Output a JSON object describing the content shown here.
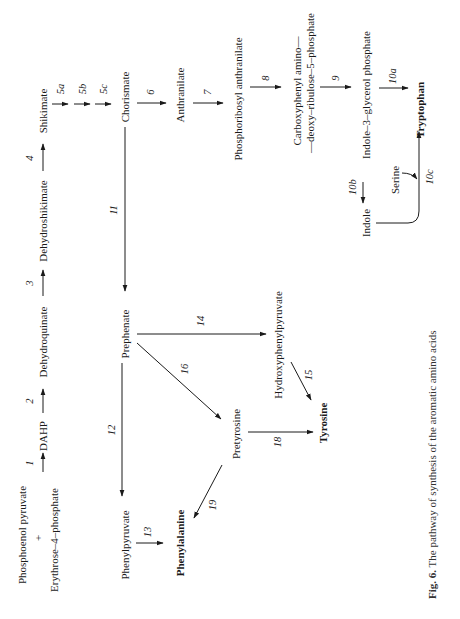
{
  "figure": {
    "caption_label": "Fig. 6.",
    "caption_text": "The pathway of synthesis of the aromatic amino acids",
    "orientation": "rotated 90° counter-clockwise"
  },
  "compounds": {
    "phosphoenol_pyruvate": "Phosphoenol pyruvate",
    "plus": "+",
    "erythrose_4_phosphate": "Erythrose–4–phosphate",
    "dahp": "DAHP",
    "dehydroquinate": "Dehydroquinate",
    "dehydroshikimate": "Dehydroshikimate",
    "shikimate": "Shikimate",
    "chorismate": "Chorismate",
    "anthranilate": "Anthranilate",
    "phosphoribosyl_anthranilate": "Phosphoribosyl  anthranilate",
    "carboxyphenyl_line1": "Carboxyphenyl  amino—",
    "carboxyphenyl_line2": "—deoxy–ribulose–5–phosphate",
    "indole_3_glycerol_phosphate": "Indole–3–glycerol phosphate",
    "tryptophan": "Tryptophan",
    "indole": "Indole",
    "serine": "Serine",
    "prephenate": "Prephenate",
    "phenylpyruvate": "Phenylpyruvate",
    "phenylalanine": "Phenylalanine",
    "hydroxyphenylpyruvate": "Hydroxyphenylpyruvate",
    "pretyrosine": "Pretyrosine",
    "tyrosine": "Tyrosine"
  },
  "steps": {
    "s1": "1",
    "s2": "2",
    "s3": "3",
    "s4": "4",
    "s5a": "5a",
    "s5b": "5b",
    "s5c": "5c",
    "s6": "6",
    "s7": "7",
    "s8": "8",
    "s9": "9",
    "s10a": "10a",
    "s10b": "10b",
    "s10c": "10c",
    "s11": "11",
    "s12": "12",
    "s13": "13",
    "s14": "14",
    "s15": "15",
    "s16": "16",
    "s18": "18",
    "s19": "19"
  },
  "end_products": [
    "Phenylalanine",
    "Tyrosine",
    "Tryptophan"
  ],
  "colors": {
    "ink": "#1a1a1a",
    "background": "#ffffff"
  }
}
